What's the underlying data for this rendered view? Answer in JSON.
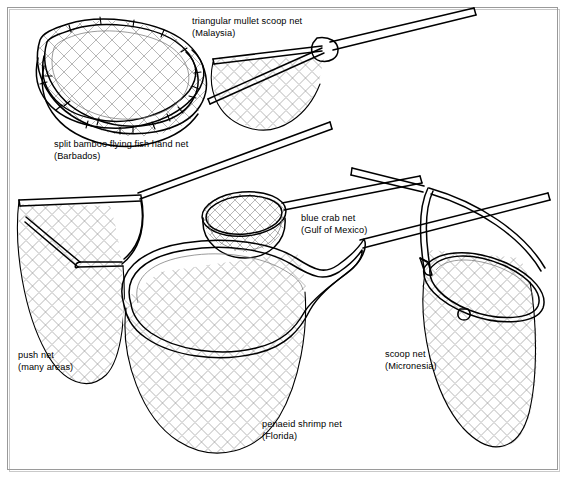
{
  "figure": {
    "background_color": "#ffffff",
    "ink_color": "#000000",
    "mesh_color": "#8a8a8a",
    "border_color": "#9a9a9a",
    "width": 565,
    "height": 479
  },
  "labels": [
    {
      "id": "split-bamboo",
      "name": "split bamboo flying fish hand net",
      "region": "(Barbados)",
      "x": 54,
      "y": 147
    },
    {
      "id": "triangular-mullet",
      "name": "triangular mullet scoop net",
      "region": "(Malaysia)",
      "x": 192,
      "y": 24
    },
    {
      "id": "blue-crab",
      "name": "blue crab net",
      "region": "(Gulf of Mexico)",
      "x": 301,
      "y": 221
    },
    {
      "id": "push-net",
      "name": "push net",
      "region": "(many areas)",
      "x": 18,
      "y": 358
    },
    {
      "id": "penaeid-shrimp",
      "name": "penaeid shrimp net",
      "region": "(Florida)",
      "x": 262,
      "y": 427
    },
    {
      "id": "scoop-net",
      "name": "scoop net",
      "region": "(Micronesia)",
      "x": 385,
      "y": 357
    }
  ]
}
